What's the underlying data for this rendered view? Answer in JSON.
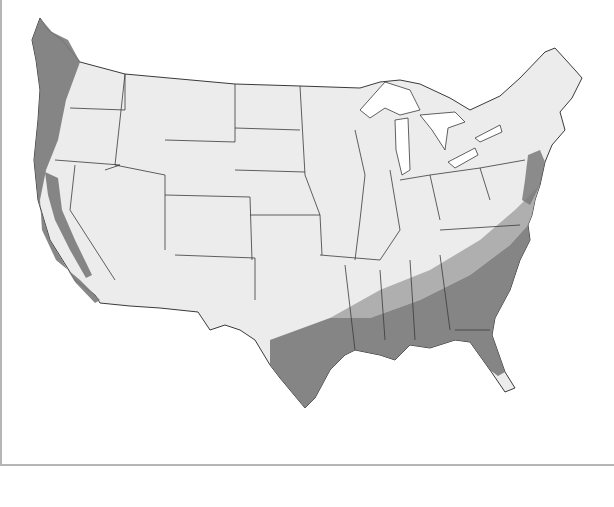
{
  "map": {
    "title": "",
    "region": "Contiguous United States",
    "style": "grayscale state outline map",
    "colors": {
      "land": "#ececec",
      "border": "#3a3a3a",
      "zone_dark": "#7a7a7a",
      "zone_medium": "#a9a9a9",
      "water": "#ffffff",
      "frame": "#b5b5b5"
    },
    "zones": [
      {
        "name": "pacific-coast-zone",
        "shade": "dark"
      },
      {
        "name": "california-central-valley-zone",
        "shade": "dark"
      },
      {
        "name": "gulf-coast-southeast-zone",
        "shade": "dark"
      },
      {
        "name": "southeast-transition-band",
        "shade": "medium"
      },
      {
        "name": "mid-atlantic-coast-zone",
        "shade": "dark"
      }
    ],
    "labels": []
  }
}
